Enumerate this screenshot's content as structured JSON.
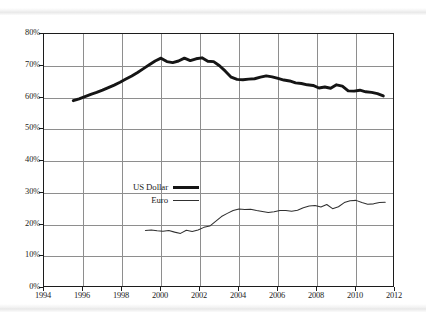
{
  "chart_data": {
    "type": "line",
    "title": "",
    "subtitle": "",
    "xlabel": "",
    "ylabel": "",
    "xlim": [
      1994,
      2012
    ],
    "ylim": [
      0,
      80
    ],
    "grid": true,
    "legend_position": "inside-left",
    "x_ticks": [
      "1994",
      "1996",
      "1998",
      "2000",
      "2002",
      "2004",
      "2006",
      "2008",
      "2010",
      "2012"
    ],
    "x_tick_values": [
      1994,
      1996,
      1998,
      2000,
      2002,
      2004,
      2006,
      2008,
      2010,
      2012
    ],
    "y_ticks": [
      "0%",
      "10%",
      "20%",
      "30%",
      "40%",
      "50%",
      "60%",
      "70%",
      "80%"
    ],
    "y_tick_values": [
      0,
      10,
      20,
      30,
      40,
      50,
      60,
      70,
      80
    ],
    "series": [
      {
        "name": "US Dollar",
        "color": "#151515",
        "line_width": 2.9,
        "x": [
          1995.5,
          1995.8,
          1996.1,
          1996.4,
          1996.7,
          1997.0,
          1997.3,
          1997.6,
          1997.9,
          1998.2,
          1998.5,
          1998.8,
          1999.1,
          1999.4,
          1999.7,
          2000.0,
          2000.3,
          2000.6,
          2000.9,
          2001.2,
          2001.5,
          2001.8,
          2002.1,
          2002.4,
          2002.7,
          2003.0,
          2003.3,
          2003.6,
          2003.9,
          2004.2,
          2004.5,
          2004.8,
          2005.1,
          2005.4,
          2005.7,
          2006.0,
          2006.3,
          2006.6,
          2006.9,
          2007.2,
          2007.5,
          2007.8,
          2008.1,
          2008.4,
          2008.7,
          2009.0,
          2009.3,
          2009.6,
          2009.9,
          2010.2,
          2010.5,
          2010.8,
          2011.1,
          2011.4
        ],
        "y": [
          59.0,
          59.6,
          60.3,
          61.0,
          61.6,
          62.3,
          63.1,
          63.9,
          64.8,
          65.8,
          66.8,
          67.9,
          69.1,
          70.3,
          71.5,
          72.4,
          71.3,
          71.0,
          71.5,
          72.4,
          71.6,
          72.2,
          72.5,
          71.4,
          71.3,
          70.0,
          68.3,
          66.4,
          65.7,
          65.6,
          65.8,
          65.9,
          66.4,
          66.8,
          66.5,
          66.0,
          65.5,
          65.2,
          64.6,
          64.4,
          64.0,
          63.8,
          63.0,
          63.3,
          62.9,
          64.0,
          63.6,
          62.1,
          62.0,
          62.3,
          61.8,
          61.6,
          61.2,
          60.5
        ],
        "start_value": 59.0,
        "peak_value": 72.5,
        "peak_year": 2002.1,
        "end_value": 60.5
      },
      {
        "name": "Euro",
        "color": "#303030",
        "line_width": 1.05,
        "x": [
          1999.2,
          1999.5,
          1999.8,
          2000.1,
          2000.4,
          2000.7,
          2001.0,
          2001.3,
          2001.6,
          2001.9,
          2002.2,
          2002.5,
          2002.8,
          2003.1,
          2003.4,
          2003.7,
          2004.0,
          2004.3,
          2004.6,
          2004.9,
          2005.2,
          2005.5,
          2005.8,
          2006.1,
          2006.4,
          2006.7,
          2007.0,
          2007.3,
          2007.6,
          2007.9,
          2008.2,
          2008.5,
          2008.8,
          2009.1,
          2009.4,
          2009.7,
          2010.0,
          2010.3,
          2010.6,
          2010.9,
          2011.2,
          2011.5
        ],
        "y": [
          18.1,
          18.3,
          18.0,
          17.9,
          18.1,
          17.6,
          17.2,
          18.2,
          17.8,
          18.3,
          19.1,
          19.5,
          21.0,
          22.5,
          23.5,
          24.4,
          24.9,
          24.7,
          24.8,
          24.4,
          24.1,
          23.8,
          24.0,
          24.4,
          24.4,
          24.2,
          24.5,
          25.3,
          25.8,
          26.0,
          25.5,
          26.3,
          25.0,
          25.6,
          26.9,
          27.5,
          27.6,
          26.9,
          26.4,
          26.5,
          26.9,
          27.0
        ],
        "start_value": 18.1,
        "end_value": 27.0
      }
    ]
  },
  "legend": {
    "items": [
      {
        "label": "US Dollar",
        "style": "usd"
      },
      {
        "label": "Euro",
        "style": "eur"
      }
    ]
  },
  "colors": {
    "usd_line": "#151515",
    "eur_line": "#303030",
    "gridline": "#8e8e8e",
    "axis_border": "#1c1c1c",
    "background": "#ffffff"
  }
}
